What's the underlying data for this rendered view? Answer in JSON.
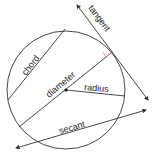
{
  "diagram": {
    "labels": {
      "tangent": "tangent",
      "chord": "chord",
      "diameter": "diameter",
      "radius": "radius",
      "secant": "secant"
    },
    "colors": {
      "line": "#333333",
      "right_angle_marker": "#e8a070",
      "center_point": "#111111"
    }
  }
}
